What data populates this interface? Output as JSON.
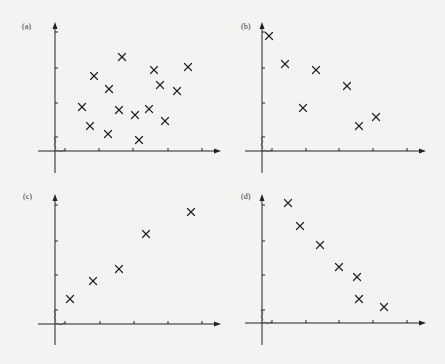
{
  "figure": {
    "background": "#f3f3f1",
    "ink": "#222222"
  },
  "chart_data": [
    {
      "type": "scatter",
      "label": "(a)",
      "description": "no correlation",
      "origin": [
        55,
        151
      ],
      "xaxis": {
        "start": 38,
        "end": 221
      },
      "yaxis": {
        "top": 22,
        "bottom": 173
      },
      "xticks_px": [
        65,
        99,
        133,
        168,
        202
      ],
      "yticks_px": [
        32,
        68,
        103,
        137
      ],
      "points_px": [
        [
          82,
          107
        ],
        [
          90,
          126
        ],
        [
          94,
          76
        ],
        [
          108,
          134
        ],
        [
          109,
          89
        ],
        [
          119,
          110
        ],
        [
          122,
          57
        ],
        [
          135,
          115
        ],
        [
          139,
          140
        ],
        [
          149,
          109
        ],
        [
          154,
          70
        ],
        [
          160,
          85
        ],
        [
          165,
          121
        ],
        [
          177,
          91
        ],
        [
          188,
          67
        ]
      ]
    },
    {
      "type": "scatter",
      "label": "(b)",
      "description": "weak negative correlation",
      "origin": [
        262,
        151
      ],
      "xaxis": {
        "start": 245,
        "end": 426
      },
      "yaxis": {
        "top": 22,
        "bottom": 173
      },
      "xticks_px": [
        272,
        306,
        339,
        373,
        407
      ],
      "yticks_px": [
        32,
        68,
        103,
        137
      ],
      "points_px": [
        [
          269,
          36
        ],
        [
          285,
          64
        ],
        [
          303,
          108
        ],
        [
          316,
          70
        ],
        [
          347,
          86
        ],
        [
          359,
          126
        ],
        [
          376,
          117
        ]
      ]
    },
    {
      "type": "scatter",
      "label": "(c)",
      "description": "positive correlation",
      "origin": [
        55,
        324
      ],
      "xaxis": {
        "start": 38,
        "end": 221
      },
      "yaxis": {
        "top": 194,
        "bottom": 345
      },
      "xticks_px": [
        65,
        100,
        134,
        168,
        202
      ],
      "yticks_px": [
        205,
        241,
        275,
        310
      ],
      "points_px": [
        [
          70,
          299
        ],
        [
          93,
          281
        ],
        [
          119,
          269
        ],
        [
          146,
          234
        ],
        [
          191,
          212
        ]
      ]
    },
    {
      "type": "scatter",
      "label": "(d)",
      "description": "strong negative correlation",
      "origin": [
        262,
        323
      ],
      "xaxis": {
        "start": 245,
        "end": 426
      },
      "yaxis": {
        "top": 194,
        "bottom": 345
      },
      "xticks_px": [
        272,
        306,
        339,
        373,
        407
      ],
      "yticks_px": [
        205,
        241,
        275,
        310
      ],
      "points_px": [
        [
          288,
          203
        ],
        [
          300,
          226
        ],
        [
          320,
          245
        ],
        [
          339,
          267
        ],
        [
          357,
          277
        ],
        [
          359,
          299
        ],
        [
          384,
          307
        ]
      ]
    }
  ],
  "panels": {
    "a": {
      "label": "(a)"
    },
    "b": {
      "label": "(b)"
    },
    "c": {
      "label": "(c)"
    },
    "d": {
      "label": "(d)"
    }
  }
}
